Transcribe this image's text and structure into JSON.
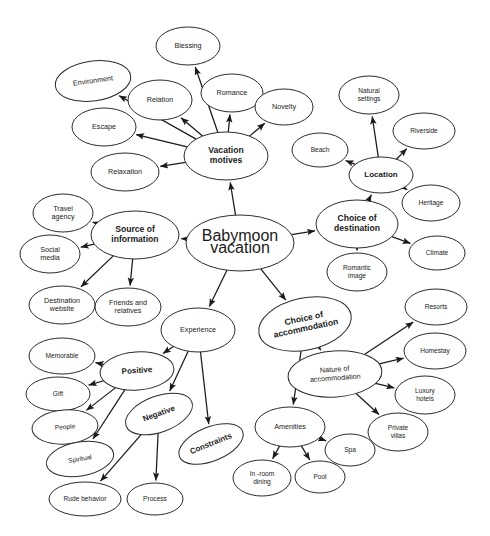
{
  "diagram": {
    "type": "mind-map",
    "background_color": "#ffffff",
    "node_fill": "#ffffff",
    "node_stroke": "#2b2b2b",
    "edge_color": "#1a1a1a"
  },
  "nodes": [
    {
      "id": "root",
      "label": "Babymoon vacation",
      "level": "root",
      "cx": 240,
      "cy": 243,
      "rx": 54,
      "ry": 28,
      "rot": 0,
      "lines": [
        "Babymoon",
        "vacation"
      ]
    },
    {
      "id": "motives",
      "label": "Vacation motives",
      "level": "lvl-1",
      "cx": 226,
      "cy": 156,
      "rx": 42,
      "ry": 24,
      "rot": 0,
      "lines": [
        "Vacation",
        "motives"
      ]
    },
    {
      "id": "blessing",
      "label": "Blessing",
      "level": "lvl-2",
      "cx": 188,
      "cy": 46,
      "rx": 32,
      "ry": 19,
      "rot": 0,
      "lines": [
        "Blessing"
      ]
    },
    {
      "id": "environment",
      "label": "Environment",
      "level": "lvl-2",
      "cx": 93,
      "cy": 81,
      "rx": 38,
      "ry": 20,
      "rot": -8,
      "lines": [
        "Environment"
      ]
    },
    {
      "id": "relation",
      "label": "Relation",
      "level": "lvl-2",
      "cx": 160,
      "cy": 100,
      "rx": 32,
      "ry": 20,
      "rot": 0,
      "lines": [
        "Relation"
      ]
    },
    {
      "id": "romance",
      "label": "Romance",
      "level": "lvl-2",
      "cx": 232,
      "cy": 93,
      "rx": 31,
      "ry": 19,
      "rot": 0,
      "lines": [
        "Romance"
      ]
    },
    {
      "id": "novelty",
      "label": "Novelty",
      "level": "lvl-2",
      "cx": 284,
      "cy": 107,
      "rx": 29,
      "ry": 18,
      "rot": 0,
      "lines": [
        "Novelty"
      ]
    },
    {
      "id": "escape",
      "label": "Escape",
      "level": "lvl-2",
      "cx": 104,
      "cy": 127,
      "rx": 32,
      "ry": 19,
      "rot": 0,
      "lines": [
        "Escape"
      ]
    },
    {
      "id": "relaxation",
      "label": "Relaxation",
      "level": "lvl-2",
      "cx": 125,
      "cy": 172,
      "rx": 34,
      "ry": 19,
      "rot": 0,
      "lines": [
        "Relaxation"
      ]
    },
    {
      "id": "destination",
      "label": "Choice of destination",
      "level": "lvl-1",
      "cx": 357,
      "cy": 224,
      "rx": 41,
      "ry": 24,
      "rot": 0,
      "lines": [
        "Choice of",
        "destination"
      ]
    },
    {
      "id": "location",
      "label": "Location",
      "level": "lvl-b",
      "cx": 381,
      "cy": 175,
      "rx": 32,
      "ry": 18,
      "rot": 0,
      "lines": [
        "Location"
      ]
    },
    {
      "id": "natsettings",
      "label": "Natural settings",
      "level": "lvl-3",
      "cx": 369,
      "cy": 95,
      "rx": 30,
      "ry": 19,
      "rot": 0,
      "lines": [
        "Natural",
        "settings"
      ]
    },
    {
      "id": "riverside",
      "label": "Riverside",
      "level": "lvl-3",
      "cx": 424,
      "cy": 131,
      "rx": 31,
      "ry": 18,
      "rot": 0,
      "lines": [
        "Riverside"
      ]
    },
    {
      "id": "beach",
      "label": "Beach",
      "level": "lvl-3",
      "cx": 320,
      "cy": 150,
      "rx": 28,
      "ry": 17,
      "rot": 0,
      "lines": [
        "Beach"
      ]
    },
    {
      "id": "heritage",
      "label": "Heritage",
      "level": "lvl-3",
      "cx": 431,
      "cy": 203,
      "rx": 29,
      "ry": 18,
      "rot": 0,
      "lines": [
        "Heritage"
      ]
    },
    {
      "id": "climate",
      "label": "Climate",
      "level": "lvl-3",
      "cx": 437,
      "cy": 253,
      "rx": 28,
      "ry": 17,
      "rot": 0,
      "lines": [
        "Climate"
      ]
    },
    {
      "id": "romanticimg",
      "label": "Romantic image",
      "level": "lvl-3",
      "cx": 357,
      "cy": 272,
      "rx": 30,
      "ry": 19,
      "rot": 0,
      "lines": [
        "Romantic",
        "image"
      ]
    },
    {
      "id": "source",
      "label": "Source of information",
      "level": "lvl-1",
      "cx": 135,
      "cy": 235,
      "rx": 44,
      "ry": 24,
      "rot": 0,
      "lines": [
        "Source of",
        "information"
      ]
    },
    {
      "id": "travelagency",
      "label": "Travel agency",
      "level": "lvl-2",
      "cx": 63,
      "cy": 213,
      "rx": 30,
      "ry": 19,
      "rot": 0,
      "lines": [
        "Travel",
        "agency"
      ]
    },
    {
      "id": "socialmedia",
      "label": "Social media",
      "level": "lvl-2",
      "cx": 50,
      "cy": 254,
      "rx": 30,
      "ry": 19,
      "rot": 0,
      "lines": [
        "Social",
        "media"
      ]
    },
    {
      "id": "destwebsite",
      "label": "Destination website",
      "level": "lvl-2",
      "cx": 62,
      "cy": 305,
      "rx": 33,
      "ry": 19,
      "rot": 0,
      "lines": [
        "Destination",
        "website"
      ]
    },
    {
      "id": "friends",
      "label": "Friends and relatives",
      "level": "lvl-2",
      "cx": 128,
      "cy": 307,
      "rx": 33,
      "ry": 19,
      "rot": 0,
      "lines": [
        "Friends  and",
        "relatives"
      ]
    },
    {
      "id": "experience",
      "label": "Experience",
      "level": "lvl-2",
      "cx": 198,
      "cy": 330,
      "rx": 37,
      "ry": 22,
      "rot": 0,
      "lines": [
        "Experience"
      ]
    },
    {
      "id": "positive",
      "label": "Positive",
      "level": "lvl-b",
      "cx": 137,
      "cy": 371,
      "rx": 37,
      "ry": 19,
      "rot": -4,
      "lines": [
        "Positive"
      ]
    },
    {
      "id": "negative",
      "label": "Negative",
      "level": "lvl-b",
      "cx": 159,
      "cy": 414,
      "rx": 35,
      "ry": 18,
      "rot": -20,
      "lines": [
        "Negative"
      ]
    },
    {
      "id": "constraints",
      "label": "Constraints",
      "level": "lvl-b",
      "cx": 211,
      "cy": 444,
      "rx": 34,
      "ry": 17,
      "rot": -22,
      "lines": [
        "Constraints"
      ]
    },
    {
      "id": "memorable",
      "label": "Memorable",
      "level": "lvl-3",
      "cx": 62,
      "cy": 356,
      "rx": 33,
      "ry": 18,
      "rot": 0,
      "lines": [
        "Memorable"
      ]
    },
    {
      "id": "gift",
      "label": "Gift",
      "level": "lvl-3",
      "cx": 58,
      "cy": 394,
      "rx": 32,
      "ry": 17,
      "rot": 0,
      "lines": [
        "Gift"
      ]
    },
    {
      "id": "people",
      "label": "People",
      "level": "lvl-3",
      "cx": 65,
      "cy": 427,
      "rx": 33,
      "ry": 17,
      "rot": -4,
      "lines": [
        "People"
      ]
    },
    {
      "id": "spiritual",
      "label": "Spiritual",
      "level": "lvl-3",
      "cx": 80,
      "cy": 459,
      "rx": 34,
      "ry": 17,
      "rot": -10,
      "lines": [
        "Spiritual"
      ]
    },
    {
      "id": "rudebehavior",
      "label": "Rude behavior",
      "level": "lvl-3",
      "cx": 85,
      "cy": 499,
      "rx": 36,
      "ry": 17,
      "rot": 0,
      "lines": [
        "Rude behavior"
      ]
    },
    {
      "id": "process",
      "label": "Process",
      "level": "lvl-3",
      "cx": 155,
      "cy": 499,
      "rx": 28,
      "ry": 16,
      "rot": 0,
      "lines": [
        "Process"
      ]
    },
    {
      "id": "accommodation",
      "label": "Choice of accommodation",
      "level": "lvl-1",
      "cx": 305,
      "cy": 324,
      "rx": 47,
      "ry": 26,
      "rot": -12,
      "lines": [
        "Choice of",
        "accommodation"
      ]
    },
    {
      "id": "nature",
      "label": "Nature of accommodation",
      "level": "lvl-2",
      "cx": 335,
      "cy": 374,
      "rx": 47,
      "ry": 23,
      "rot": -4,
      "lines": [
        "Nature of",
        "accommodation"
      ]
    },
    {
      "id": "resorts",
      "label": "Resorts",
      "level": "lvl-3",
      "cx": 436,
      "cy": 307,
      "rx": 31,
      "ry": 18,
      "rot": 0,
      "lines": [
        "Resorts"
      ]
    },
    {
      "id": "homestay",
      "label": "Homestay",
      "level": "lvl-3",
      "cx": 435,
      "cy": 351,
      "rx": 31,
      "ry": 18,
      "rot": 0,
      "lines": [
        "Homestay"
      ]
    },
    {
      "id": "luxuryhotels",
      "label": "Luxury hotels",
      "level": "lvl-3",
      "cx": 425,
      "cy": 395,
      "rx": 30,
      "ry": 19,
      "rot": 0,
      "lines": [
        "Luxury",
        "hotels"
      ]
    },
    {
      "id": "privatevillas",
      "label": "Private villas",
      "level": "lvl-3",
      "cx": 398,
      "cy": 432,
      "rx": 30,
      "ry": 19,
      "rot": 0,
      "lines": [
        "Private",
        "villas"
      ]
    },
    {
      "id": "amenities",
      "label": "Amenities",
      "level": "lvl-2",
      "cx": 290,
      "cy": 427,
      "rx": 35,
      "ry": 20,
      "rot": 0,
      "lines": [
        "Amenities"
      ]
    },
    {
      "id": "inroomdining",
      "label": "In-room dining",
      "level": "lvl-3",
      "cx": 262,
      "cy": 478,
      "rx": 29,
      "ry": 18,
      "rot": 0,
      "lines": [
        "In -room",
        "dining"
      ]
    },
    {
      "id": "pool",
      "label": "Pool",
      "level": "lvl-3",
      "cx": 320,
      "cy": 477,
      "rx": 25,
      "ry": 16,
      "rot": 0,
      "lines": [
        "Pool"
      ]
    },
    {
      "id": "spa",
      "label": "Spa",
      "level": "lvl-3",
      "cx": 350,
      "cy": 450,
      "rx": 25,
      "ry": 16,
      "rot": 0,
      "lines": [
        "Spa"
      ]
    }
  ],
  "edges": [
    {
      "from": "root",
      "to": "motives"
    },
    {
      "from": "root",
      "to": "destination"
    },
    {
      "from": "root",
      "to": "source"
    },
    {
      "from": "root",
      "to": "experience"
    },
    {
      "from": "root",
      "to": "accommodation"
    },
    {
      "from": "motives",
      "to": "blessing"
    },
    {
      "from": "motives",
      "to": "environment"
    },
    {
      "from": "motives",
      "to": "relation"
    },
    {
      "from": "motives",
      "to": "romance"
    },
    {
      "from": "motives",
      "to": "novelty"
    },
    {
      "from": "motives",
      "to": "escape"
    },
    {
      "from": "motives",
      "to": "relaxation"
    },
    {
      "from": "destination",
      "to": "location"
    },
    {
      "from": "destination",
      "to": "climate"
    },
    {
      "from": "destination",
      "to": "romanticimg"
    },
    {
      "from": "location",
      "to": "natsettings"
    },
    {
      "from": "location",
      "to": "riverside"
    },
    {
      "from": "location",
      "to": "beach"
    },
    {
      "from": "location",
      "to": "heritage"
    },
    {
      "from": "source",
      "to": "travelagency"
    },
    {
      "from": "source",
      "to": "socialmedia"
    },
    {
      "from": "source",
      "to": "destwebsite"
    },
    {
      "from": "source",
      "to": "friends"
    },
    {
      "from": "experience",
      "to": "positive"
    },
    {
      "from": "experience",
      "to": "negative"
    },
    {
      "from": "experience",
      "to": "constraints"
    },
    {
      "from": "positive",
      "to": "memorable"
    },
    {
      "from": "positive",
      "to": "gift"
    },
    {
      "from": "positive",
      "to": "people"
    },
    {
      "from": "positive",
      "to": "spiritual"
    },
    {
      "from": "negative",
      "to": "rudebehavior"
    },
    {
      "from": "negative",
      "to": "process"
    },
    {
      "from": "accommodation",
      "to": "nature"
    },
    {
      "from": "accommodation",
      "to": "amenities"
    },
    {
      "from": "nature",
      "to": "resorts"
    },
    {
      "from": "nature",
      "to": "homestay"
    },
    {
      "from": "nature",
      "to": "luxuryhotels"
    },
    {
      "from": "nature",
      "to": "privatevillas"
    },
    {
      "from": "amenities",
      "to": "inroomdining"
    },
    {
      "from": "amenities",
      "to": "pool"
    },
    {
      "from": "amenities",
      "to": "spa"
    }
  ]
}
